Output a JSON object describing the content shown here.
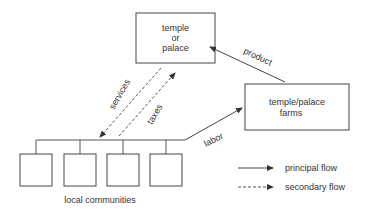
{
  "diagram": {
    "nodes": {
      "temple": {
        "lines": [
          "temple",
          "or",
          "palace"
        ]
      },
      "farms": {
        "lines": [
          "temple/palace",
          "farms"
        ]
      },
      "communities": {
        "label": "local communities",
        "count": 4
      }
    },
    "flows": {
      "product": "product",
      "services": "services",
      "taxes": "taxes",
      "labor": "labor"
    },
    "legend": {
      "principal": "principal flow",
      "secondary": "secondary flow"
    },
    "colors": {
      "stroke": "#444444",
      "text": "#333333",
      "background": "#ffffff"
    }
  }
}
